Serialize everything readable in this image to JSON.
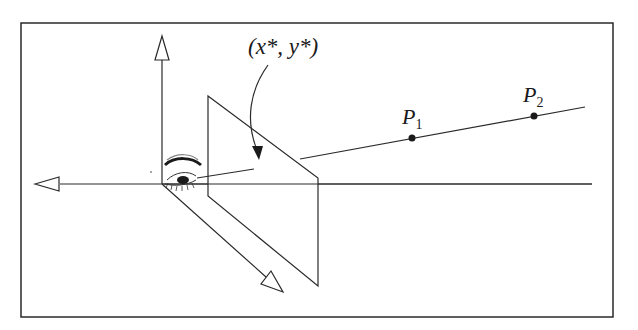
{
  "figure": {
    "labels": {
      "projection_point": "(x*, y*)",
      "p1": "P",
      "p1_sub": "1",
      "p2": "P",
      "p2_sub": "2"
    },
    "colors": {
      "stroke": "#2a2a2a",
      "background": "#ffffff"
    }
  }
}
